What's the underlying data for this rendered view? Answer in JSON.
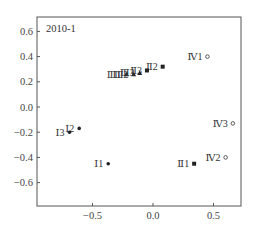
{
  "chart_data": {
    "type": "scatter",
    "title": "2010-1",
    "xlabel": "",
    "ylabel": "",
    "xlim": [
      -0.95,
      0.72
    ],
    "ylim": [
      -0.78,
      0.72
    ],
    "x_ticks": [
      -0.5,
      0.0,
      0.5
    ],
    "x_tick_labels": [
      "-0.5",
      "0.0",
      "0.5"
    ],
    "y_ticks": [
      0.6,
      0.4,
      0.2,
      0.0,
      -0.2,
      -0.4,
      -0.6
    ],
    "y_tick_labels": [
      "0.6",
      "0.4",
      "0.2",
      "0.0",
      "-0.2",
      "-0.4",
      "-0.6"
    ],
    "grid": false,
    "legend": "none",
    "series": [
      {
        "name": "I",
        "marker": "filled-circle",
        "points": [
          {
            "label": "I 1",
            "x": -0.37,
            "y": -0.45
          },
          {
            "label": "I 2",
            "x": -0.61,
            "y": -0.17
          },
          {
            "label": "I 3",
            "x": -0.69,
            "y": -0.2
          }
        ]
      },
      {
        "name": "II",
        "marker": "filled-square",
        "points": [
          {
            "label": "II 1",
            "x": 0.34,
            "y": -0.45
          },
          {
            "label": "II 2",
            "x": 0.08,
            "y": 0.32
          },
          {
            "label": "II 3",
            "x": -0.05,
            "y": 0.29
          }
        ]
      },
      {
        "name": "III",
        "marker": "filled-triangle",
        "points": [
          {
            "label": "III 1",
            "x": -0.22,
            "y": 0.26
          },
          {
            "label": "III 2",
            "x": -0.16,
            "y": 0.26
          },
          {
            "label": "III 3",
            "x": -0.11,
            "y": 0.27
          }
        ]
      },
      {
        "name": "IV",
        "marker": "open-circle",
        "points": [
          {
            "label": "IV 1",
            "x": 0.45,
            "y": 0.4
          },
          {
            "label": "IV 2",
            "x": 0.6,
            "y": -0.4
          },
          {
            "label": "IV 3",
            "x": 0.66,
            "y": -0.13
          }
        ]
      }
    ]
  }
}
